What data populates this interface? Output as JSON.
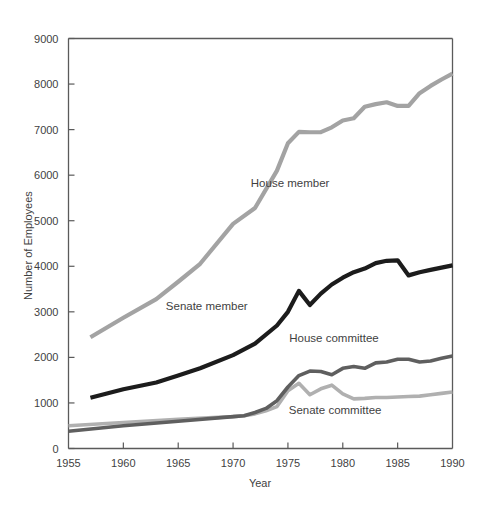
{
  "chart_data": {
    "type": "line",
    "title": "",
    "xlabel": "Year",
    "ylabel": "Number of Employees",
    "xlim": [
      1955,
      1990
    ],
    "ylim": [
      0,
      9000
    ],
    "xticks": [
      1955,
      1960,
      1965,
      1970,
      1975,
      1980,
      1985,
      1990
    ],
    "yticks": [
      0,
      1000,
      2000,
      3000,
      4000,
      5000,
      6000,
      7000,
      8000,
      9000
    ],
    "grid": false,
    "legend": "inline-annotations",
    "series": [
      {
        "name": "House member",
        "color": "#a3a3a3",
        "width": 4.2,
        "label_x": 1975.2,
        "label_y": 5750,
        "x": [
          1957,
          1960,
          1963,
          1965,
          1967,
          1970,
          1972,
          1974,
          1975,
          1976,
          1977,
          1978,
          1979,
          1980,
          1981,
          1982,
          1983,
          1984,
          1985,
          1986,
          1987,
          1988,
          1989,
          1990
        ],
        "y": [
          2441,
          2870,
          3280,
          3660,
          4055,
          4930,
          5280,
          6100,
          6700,
          6950,
          6942,
          6944,
          7050,
          7200,
          7250,
          7500,
          7560,
          7600,
          7520,
          7520,
          7800,
          7960,
          8100,
          8230
        ]
      },
      {
        "name": "Senate member",
        "color": "#1c1c1c",
        "width": 4.2,
        "label_x": 1967.6,
        "label_y": 3050,
        "x": [
          1957,
          1960,
          1963,
          1965,
          1967,
          1970,
          1972,
          1974,
          1975,
          1976,
          1977,
          1978,
          1979,
          1980,
          1981,
          1982,
          1983,
          1984,
          1985,
          1986,
          1987,
          1988,
          1989,
          1990
        ],
        "y": [
          1115,
          1300,
          1450,
          1600,
          1760,
          2050,
          2300,
          2700,
          3000,
          3460,
          3150,
          3400,
          3600,
          3750,
          3870,
          3950,
          4070,
          4120,
          4130,
          3800,
          3870,
          3920,
          3970,
          4020
        ]
      },
      {
        "name": "House committee",
        "color": "#5f5f5f",
        "width": 3.6,
        "label_x": 1979.2,
        "label_y": 2330,
        "x": [
          1955,
          1960,
          1965,
          1970,
          1971,
          1972,
          1973,
          1974,
          1975,
          1976,
          1977,
          1978,
          1979,
          1980,
          1981,
          1982,
          1983,
          1984,
          1985,
          1986,
          1987,
          1988,
          1989,
          1990
        ],
        "y": [
          380,
          500,
          600,
          700,
          720,
          790,
          880,
          1050,
          1350,
          1600,
          1700,
          1690,
          1620,
          1760,
          1800,
          1760,
          1880,
          1900,
          1960,
          1960,
          1900,
          1920,
          1980,
          2030
        ]
      },
      {
        "name": "Senate committee",
        "color": "#b0b0b0",
        "width": 3.6,
        "label_x": 1979.3,
        "label_y": 760,
        "x": [
          1955,
          1960,
          1965,
          1970,
          1971,
          1972,
          1973,
          1974,
          1975,
          1976,
          1977,
          1978,
          1979,
          1980,
          1981,
          1982,
          1983,
          1984,
          1985,
          1986,
          1987,
          1988,
          1989,
          1990
        ],
        "y": [
          500,
          570,
          640,
          700,
          720,
          760,
          830,
          920,
          1270,
          1430,
          1180,
          1310,
          1390,
          1200,
          1090,
          1100,
          1120,
          1120,
          1130,
          1140,
          1150,
          1180,
          1210,
          1240
        ]
      }
    ]
  },
  "axes": {
    "y_title": "Number of Employees",
    "x_title": "Year",
    "x_tick_labels": [
      "1955",
      "1960",
      "1965",
      "1970",
      "1975",
      "1980",
      "1985",
      "1990"
    ],
    "y_tick_labels": [
      "0",
      "1000",
      "2000",
      "3000",
      "4000",
      "5000",
      "6000",
      "7000",
      "8000",
      "9000"
    ]
  },
  "annotations": {
    "house_member": "House member",
    "senate_member": "Senate member",
    "house_committee": "House committee",
    "senate_committee": "Senate committee"
  }
}
